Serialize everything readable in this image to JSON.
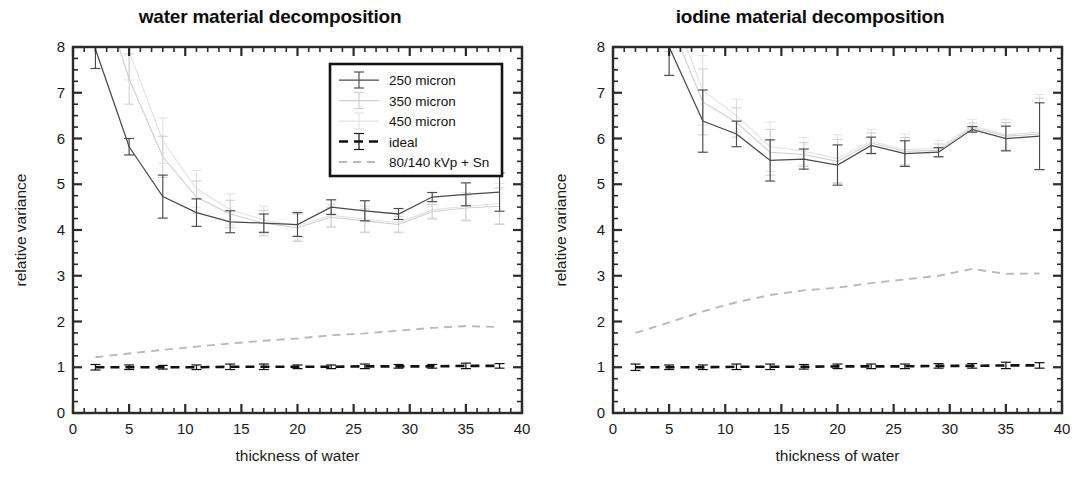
{
  "figure": {
    "panels": [
      {
        "id": "water",
        "title": "water material decomposition",
        "xlabel": "thickness of water",
        "ylabel": "relative variance",
        "xlim": [
          0,
          40
        ],
        "ylim": [
          0,
          8
        ],
        "xticks": [
          0,
          5,
          10,
          15,
          20,
          25,
          30,
          35,
          40
        ],
        "xticklabels": [
          "0",
          "5",
          "10",
          "15",
          "20",
          "25",
          "30",
          "35",
          "40"
        ],
        "yticks": [
          0,
          1,
          2,
          3,
          4,
          5,
          6,
          7,
          8
        ],
        "yticklabels": [
          "0",
          "1",
          "2",
          "3",
          "4",
          "5",
          "6",
          "7",
          "8"
        ],
        "minor_x_step": 1,
        "minor_y_step": 0.25,
        "has_legend": true
      },
      {
        "id": "iodine",
        "title": "iodine material decomposition",
        "xlabel": "thickness of water",
        "ylabel": "relative variance",
        "xlim": [
          0,
          40
        ],
        "ylim": [
          0,
          8
        ],
        "xticks": [
          0,
          5,
          10,
          15,
          20,
          25,
          30,
          35,
          40
        ],
        "xticklabels": [
          "0",
          "5",
          "10",
          "15",
          "20",
          "25",
          "30",
          "35",
          "40"
        ],
        "yticks": [
          0,
          1,
          2,
          3,
          4,
          5,
          6,
          7,
          8
        ],
        "yticklabels": [
          "0",
          "1",
          "2",
          "3",
          "4",
          "5",
          "6",
          "7",
          "8"
        ],
        "minor_x_step": 1,
        "minor_y_step": 0.25,
        "has_legend": false
      }
    ],
    "legend": {
      "entries": [
        {
          "label": "250 micron",
          "color": "#4a4a4a",
          "style": "errorbar"
        },
        {
          "label": "350 micron",
          "color": "#cfcfcf",
          "style": "errorbar"
        },
        {
          "label": "450 micron",
          "color": "#e2e2e2",
          "style": "errorbar"
        },
        {
          "label": "ideal",
          "color": "#111111",
          "style": "dashed-errorbar"
        },
        {
          "label": "80/140 kVp + Sn",
          "color": "#b9b9b9",
          "style": "dashed"
        }
      ]
    }
  },
  "chart_data": [
    {
      "type": "line",
      "id": "water",
      "title": "water material decomposition",
      "xlabel": "thickness of water",
      "ylabel": "relative variance",
      "xlim": [
        0,
        40
      ],
      "ylim": [
        0,
        8
      ],
      "grid": false,
      "legend_position": "upper-right",
      "series": [
        {
          "name": "250 micron",
          "color": "#4a4a4a",
          "x": [
            2,
            5,
            8,
            11,
            14,
            17,
            20,
            23,
            26,
            29,
            32,
            35,
            38
          ],
          "y": [
            7.95,
            5.82,
            4.73,
            4.38,
            4.18,
            4.15,
            4.12,
            4.5,
            4.42,
            4.35,
            4.72,
            4.78,
            4.83
          ],
          "yerr": [
            0.42,
            0.18,
            0.47,
            0.3,
            0.24,
            0.2,
            0.26,
            0.16,
            0.22,
            0.12,
            0.1,
            0.25,
            0.42
          ]
        },
        {
          "name": "350 micron",
          "color": "#cfcfcf",
          "x": [
            2,
            5,
            8,
            11,
            14,
            17,
            20,
            23,
            26,
            29,
            32,
            35,
            38
          ],
          "y": [
            9.6,
            7.3,
            5.6,
            4.72,
            4.35,
            4.15,
            4.05,
            4.28,
            4.2,
            4.12,
            4.4,
            4.48,
            4.52
          ],
          "yerr": [
            0.6,
            0.55,
            0.45,
            0.35,
            0.3,
            0.28,
            0.3,
            0.22,
            0.26,
            0.18,
            0.16,
            0.28,
            0.4
          ]
        },
        {
          "name": "450 micron",
          "color": "#e2e2e2",
          "x": [
            2,
            5,
            8,
            11,
            14,
            17,
            20,
            23,
            26,
            29,
            32,
            35,
            38
          ],
          "y": [
            10.2,
            7.9,
            5.95,
            4.9,
            4.45,
            4.22,
            4.1,
            4.32,
            4.24,
            4.16,
            4.44,
            4.52,
            4.58
          ],
          "yerr": [
            0.7,
            0.62,
            0.5,
            0.4,
            0.34,
            0.3,
            0.32,
            0.24,
            0.28,
            0.2,
            0.18,
            0.3,
            0.44
          ]
        },
        {
          "name": "ideal",
          "color": "#111111",
          "x": [
            2,
            5,
            8,
            11,
            14,
            17,
            20,
            23,
            26,
            29,
            32,
            35,
            38
          ],
          "y": [
            1.0,
            1.0,
            1.0,
            1.0,
            1.01,
            1.01,
            1.01,
            1.01,
            1.02,
            1.02,
            1.02,
            1.03,
            1.03
          ],
          "yerr": [
            0.06,
            0.05,
            0.04,
            0.05,
            0.06,
            0.06,
            0.04,
            0.04,
            0.05,
            0.04,
            0.04,
            0.06,
            0.05
          ]
        },
        {
          "name": "80/140 kVp + Sn",
          "color": "#b9b9b9",
          "x": [
            2,
            5,
            8,
            11,
            14,
            17,
            20,
            23,
            26,
            29,
            32,
            35,
            38
          ],
          "y": [
            1.22,
            1.3,
            1.38,
            1.45,
            1.52,
            1.58,
            1.63,
            1.7,
            1.74,
            1.8,
            1.86,
            1.9,
            1.88
          ],
          "yerr": [
            0,
            0,
            0,
            0,
            0,
            0,
            0,
            0,
            0,
            0,
            0,
            0,
            0
          ]
        }
      ]
    },
    {
      "type": "line",
      "id": "iodine",
      "title": "iodine material decomposition",
      "xlabel": "thickness of water",
      "ylabel": "relative variance",
      "xlim": [
        0,
        40
      ],
      "ylim": [
        0,
        8
      ],
      "grid": false,
      "legend_position": "none",
      "series": [
        {
          "name": "250 micron",
          "color": "#4a4a4a",
          "x": [
            2,
            5,
            8,
            11,
            14,
            17,
            20,
            23,
            26,
            29,
            32,
            35,
            38
          ],
          "y": [
            9.8,
            8.0,
            6.38,
            6.1,
            5.52,
            5.55,
            5.42,
            5.85,
            5.67,
            5.7,
            6.2,
            6.0,
            6.05
          ],
          "yerr": [
            0.7,
            0.62,
            0.68,
            0.28,
            0.45,
            0.22,
            0.44,
            0.18,
            0.28,
            0.1,
            0.06,
            0.27,
            0.73
          ]
        },
        {
          "name": "350 micron",
          "color": "#cfcfcf",
          "x": [
            2,
            5,
            8,
            11,
            14,
            17,
            20,
            23,
            26,
            29,
            32,
            35,
            38
          ],
          "y": [
            11.0,
            8.6,
            6.8,
            6.35,
            5.7,
            5.65,
            5.5,
            5.9,
            5.72,
            5.74,
            6.24,
            6.05,
            6.1
          ],
          "yerr": [
            0.8,
            0.7,
            0.72,
            0.32,
            0.5,
            0.26,
            0.48,
            0.22,
            0.3,
            0.14,
            0.1,
            0.3,
            0.78
          ]
        },
        {
          "name": "450 micron",
          "color": "#e2e2e2",
          "x": [
            2,
            5,
            8,
            11,
            14,
            17,
            20,
            23,
            26,
            29,
            32,
            35,
            38
          ],
          "y": [
            11.6,
            9.0,
            7.05,
            6.5,
            5.82,
            5.72,
            5.56,
            5.94,
            5.76,
            5.78,
            6.28,
            6.08,
            6.14
          ],
          "yerr": [
            0.88,
            0.76,
            0.76,
            0.36,
            0.54,
            0.3,
            0.52,
            0.26,
            0.34,
            0.18,
            0.14,
            0.34,
            0.82
          ]
        },
        {
          "name": "ideal",
          "color": "#111111",
          "x": [
            2,
            5,
            8,
            11,
            14,
            17,
            20,
            23,
            26,
            29,
            32,
            35,
            38
          ],
          "y": [
            1.0,
            1.0,
            1.0,
            1.01,
            1.01,
            1.01,
            1.02,
            1.02,
            1.02,
            1.03,
            1.03,
            1.04,
            1.04
          ],
          "yerr": [
            0.07,
            0.05,
            0.05,
            0.06,
            0.06,
            0.05,
            0.05,
            0.05,
            0.05,
            0.05,
            0.05,
            0.07,
            0.06
          ]
        },
        {
          "name": "80/140 kVp + Sn",
          "color": "#b9b9b9",
          "x": [
            2,
            5,
            8,
            11,
            14,
            17,
            20,
            23,
            26,
            29,
            32,
            35,
            38
          ],
          "y": [
            1.75,
            1.98,
            2.22,
            2.42,
            2.58,
            2.68,
            2.74,
            2.84,
            2.92,
            3.0,
            3.15,
            3.04,
            3.05
          ],
          "yerr": [
            0,
            0,
            0,
            0,
            0,
            0,
            0,
            0,
            0,
            0,
            0,
            0,
            0
          ]
        }
      ]
    }
  ]
}
